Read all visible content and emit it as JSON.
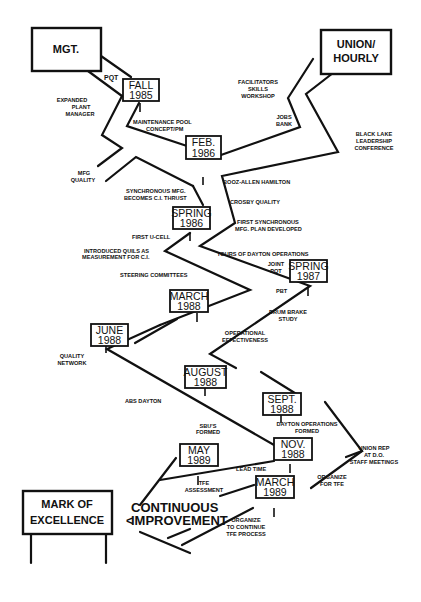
{
  "title_boxes": {
    "management": {
      "line1": "MGT.",
      "line2": ""
    },
    "union": {
      "line1": "UNION/",
      "line2": "HOURLY"
    },
    "mark": {
      "line1": "MARK OF",
      "line2": "EXCELLENCE"
    }
  },
  "goal": {
    "line1": "CONTINUOUS",
    "line2": "IMPROVEMENT"
  },
  "milestones": [
    {
      "id": "fall-1985",
      "line1": "FALL",
      "line2": "1985"
    },
    {
      "id": "feb-1986",
      "line1": "FEB.",
      "line2": "1986"
    },
    {
      "id": "spring-1986",
      "line1": "SPRING",
      "line2": "1986"
    },
    {
      "id": "spring-1987",
      "line1": "SPRING",
      "line2": "1987"
    },
    {
      "id": "march-1988",
      "line1": "MARCH",
      "line2": "1988"
    },
    {
      "id": "june-1988",
      "line1": "JUNE",
      "line2": "1988"
    },
    {
      "id": "august-1988",
      "line1": "AUGUST",
      "line2": "1988"
    },
    {
      "id": "sept-1988",
      "line1": "SEPT.",
      "line2": "1988"
    },
    {
      "id": "nov-1988",
      "line1": "NOV.",
      "line2": "1988"
    },
    {
      "id": "may-1989",
      "line1": "MAY",
      "line2": "1989"
    },
    {
      "id": "march-1989",
      "line1": "MARCH",
      "line2": "1989"
    }
  ],
  "labels": {
    "pqt": [
      "PQT"
    ],
    "expanded_plant_manager": [
      "EXPANDED",
      "PLANT",
      "MANAGER"
    ],
    "maintenance_pool": [
      "MAINTENANCE POOL",
      "CONCEPT/PM"
    ],
    "mfg_quality": [
      "MFG",
      "QUALITY"
    ],
    "facilitators": [
      "FACILITATORS",
      "SKILLS",
      "WORKSHOP"
    ],
    "jobs_bank": [
      "JOBS",
      "BANK"
    ],
    "black_lake": [
      "BLACK LAKE",
      "LEADERSHIP",
      "CONFERENCE"
    ],
    "booz_allen": [
      "BOOZ-ALLEN HAMILTON"
    ],
    "crosby": [
      "CROSBY QUALITY"
    ],
    "first_synchronous": [
      "FIRST SYNCHRONOUS",
      "MFG. PLAN DEVELOPED"
    ],
    "synchronous_mfg": [
      "SYNCHRONOUS MFG.",
      "BECOMES C.I. THRUST"
    ],
    "first_ucell": [
      "FIRST U-CELL"
    ],
    "quils": [
      "INTRODUCED QUILS AS",
      "MEASUREMENT FOR C.I."
    ],
    "tours": [
      "TOURS OF DAYTON OPERATIONS"
    ],
    "joint_pqt": [
      "JOINT",
      "PQT"
    ],
    "pbt": [
      "PBT"
    ],
    "steering": [
      "STEERING COMMITTEES"
    ],
    "drum_brake": [
      "DRUM BRAKE",
      "STUDY"
    ],
    "operational": [
      "OPERATIONAL",
      "EFFECTIVENESS"
    ],
    "quality_network": [
      "QUALITY",
      "NETWORK"
    ],
    "abs_dayton": [
      "ABS DAYTON"
    ],
    "sbus": [
      "SBU'S",
      "FORMED"
    ],
    "dayton_ops": [
      "DAYTON OPERATIONS",
      "FORMED"
    ],
    "union_rep": [
      "UNION REP",
      "AT D.O.",
      "STAFF MEETINGS"
    ],
    "lead_time": [
      "LEAD TIME"
    ],
    "organize_tfe": [
      "ORGANIZE",
      "FOR TFE"
    ],
    "tfe_assessment": [
      "TFE",
      "ASSESSMENT"
    ],
    "organize_continue": [
      "ORGANIZE",
      "TO CONTINUE",
      "TFE PROCESS"
    ]
  }
}
